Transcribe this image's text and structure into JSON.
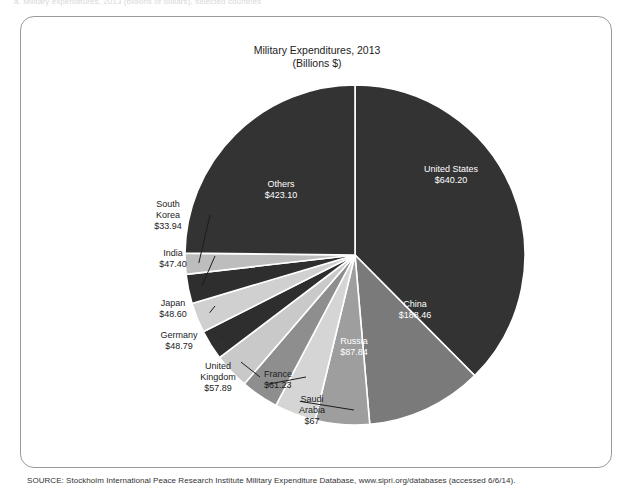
{
  "scan": {
    "ghost_caption": "a. Military expenditures, 2013 (billions of dollars), selected countries"
  },
  "card": {
    "title_line1": "Military Expenditures, 2013",
    "title_line2": "(Billions $)",
    "source": "SOURCE: Stockholm International Peace Research Institute Military Expenditure Database, www.sipri.org/databases (accessed 6/6/14)."
  },
  "chart_data": {
    "type": "pie",
    "title": "Military Expenditures, 2013",
    "subtitle": "(Billions $)",
    "unit": "Billions $",
    "start_angle_deg": 0,
    "direction": "clockwise",
    "categories": [
      "United States",
      "China",
      "Russia",
      "Saudi Arabia",
      "France",
      "United Kingdom",
      "Germany",
      "Japan",
      "India",
      "South Korea",
      "Others"
    ],
    "values": [
      640.2,
      188.46,
      87.84,
      67,
      61.23,
      57.89,
      48.79,
      48.6,
      47.4,
      33.94,
      423.1
    ],
    "value_labels": [
      "$640.20",
      "$188.46",
      "$87.84",
      "$67",
      "$61.23",
      "$57.89",
      "$48.79",
      "$48.60",
      "$47.40",
      "$33.94",
      "$423.10"
    ],
    "colors": [
      "#333333",
      "#7a7a7a",
      "#9e9e9e",
      "#d5d5d5",
      "#8e8e8e",
      "#c9c9c9",
      "#2e2e2e",
      "#d0d0d0",
      "#2e2e2e",
      "#bdbdbd",
      "#333333"
    ],
    "label_placement": [
      "inside",
      "inside",
      "inside",
      "outside",
      "outside",
      "outside",
      "outside",
      "outside",
      "outside",
      "outside",
      "inside"
    ],
    "legend": "none",
    "grid": false
  },
  "slices": [
    {
      "name": "United States",
      "value_label": "$640.20",
      "label_x": 430,
      "label_y": 155,
      "anchor": "middle",
      "placement": "inside"
    },
    {
      "name": "China",
      "value_label": "$188.46",
      "label_x": 394,
      "label_y": 290,
      "anchor": "middle",
      "placement": "inside"
    },
    {
      "name": "Russia",
      "value_label": "$87.84",
      "label_x": 333,
      "label_y": 327,
      "anchor": "middle",
      "placement": "inside"
    },
    {
      "name": "Saudi",
      "value_label": "Arabia",
      "extra_label": "$67",
      "label_x": 291,
      "label_y": 385,
      "anchor": "middle",
      "placement": "outside"
    },
    {
      "name": "France",
      "value_label": "$61.23",
      "label_x": 243,
      "label_y": 360,
      "anchor": "start",
      "placement": "outside"
    },
    {
      "name": "United",
      "value_label": "Kingdom",
      "extra_label": "$57.89",
      "label_x": 197,
      "label_y": 352,
      "anchor": "middle",
      "placement": "outside"
    },
    {
      "name": "Germany",
      "value_label": "$48.79",
      "label_x": 158,
      "label_y": 321,
      "anchor": "middle",
      "placement": "outside"
    },
    {
      "name": "Japan",
      "value_label": "$48.60",
      "label_x": 152,
      "label_y": 289,
      "anchor": "middle",
      "placement": "outside"
    },
    {
      "name": "India",
      "value_label": "$47.40",
      "label_x": 152,
      "label_y": 239,
      "anchor": "middle",
      "placement": "outside"
    },
    {
      "name": "South",
      "value_label": "Korea",
      "extra_label": "$33.94",
      "label_x": 147,
      "label_y": 190,
      "anchor": "middle",
      "placement": "outside"
    },
    {
      "name": "Others",
      "value_label": "$423.10",
      "label_x": 260,
      "label_y": 170,
      "anchor": "middle",
      "placement": "inside"
    }
  ]
}
